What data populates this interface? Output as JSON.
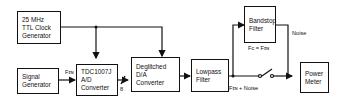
{
  "diagram": {
    "blocks": {
      "clock": [
        "25 MHz",
        "TTL Clock",
        "Generator"
      ],
      "signal": [
        "Signal",
        "Generator"
      ],
      "adc": [
        "TDC1007J",
        "A/D",
        "Converter"
      ],
      "dac": [
        "Deglitched",
        "D/A",
        "Converter"
      ],
      "lowpass": [
        "Lowpass",
        "Filter"
      ],
      "bandstop": [
        "Bandstop",
        "Filter"
      ],
      "power": [
        "Power",
        "Meter"
      ]
    },
    "labels": {
      "fin": "Fɪɴ",
      "bus_width": "8",
      "fc": "Fc = Fɪɴ",
      "noise": "Noise",
      "fin_noise": "Fɪɴ + Noise"
    }
  }
}
